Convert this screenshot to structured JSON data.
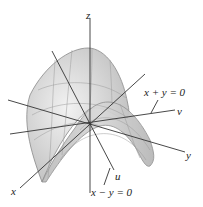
{
  "figure": {
    "type": "saddle surface (hyperbolic paraboloid) with rotated axes",
    "labels": {
      "z": "z",
      "x": "x",
      "y": "y",
      "u": "u",
      "v": "v",
      "x_plus_y": "x + y = 0",
      "x_minus_y": "x − y = 0"
    },
    "colors": {
      "surface_fill": "#cfcfcf",
      "surface_edge": "#8a8a8a",
      "axis": "#333333",
      "grid": "#9a9a9a"
    }
  }
}
